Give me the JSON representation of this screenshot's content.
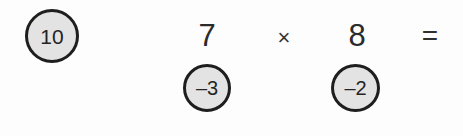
{
  "canvas": {
    "width": 463,
    "height": 136,
    "background_color": "#fdfdfd"
  },
  "style": {
    "bubble_fill": "#e3e3e3",
    "bubble_stroke": "#1e1e1e",
    "text_color": "#2b2b2b"
  },
  "worksheet": {
    "expression": {
      "factor_1": "7",
      "operator": "×",
      "factor_2": "8",
      "equals": "="
    },
    "annotations": {
      "answer_bubble": "10",
      "hint_bubble_1": "–3",
      "hint_bubble_2": "–2"
    }
  }
}
